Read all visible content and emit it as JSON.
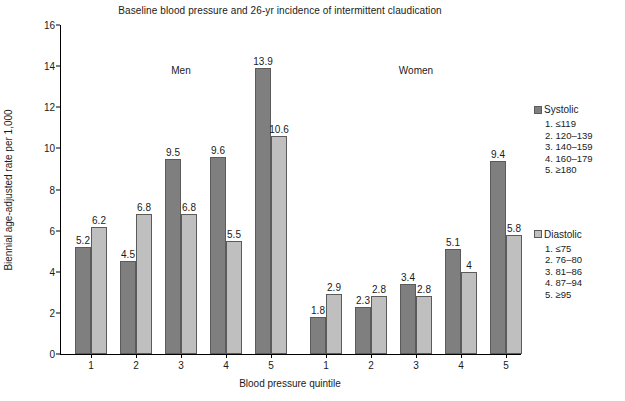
{
  "chart_data": {
    "type": "bar",
    "title": "Baseline blood pressure and 26-yr incidence of intermittent claudication",
    "xlabel": "Blood pressure quintile",
    "ylabel": "Biennial age-adjusted rate per 1,000",
    "ylim": [
      0,
      16
    ],
    "ytick_step": 2,
    "yticks": [
      "0",
      "2",
      "4",
      "6",
      "8",
      "10",
      "12",
      "14",
      "16"
    ],
    "grid": false,
    "legend_position": "right",
    "categories": [
      "1",
      "2",
      "3",
      "4",
      "5"
    ],
    "groups": [
      {
        "name": "Men",
        "categories": [
          "1",
          "2",
          "3",
          "4",
          "5"
        ],
        "series": [
          {
            "name": "Systolic",
            "values": [
              5.2,
              4.5,
              9.5,
              9.6,
              13.9
            ],
            "labels": [
              "5.2",
              "4.5",
              "9.5",
              "9.6",
              "13.9"
            ]
          },
          {
            "name": "Diastolic",
            "values": [
              6.2,
              6.8,
              6.8,
              5.5,
              10.6
            ],
            "labels": [
              "6.2",
              "6.8",
              "6.8",
              "5.5",
              "10.6"
            ]
          }
        ]
      },
      {
        "name": "Women",
        "categories": [
          "1",
          "2",
          "3",
          "4",
          "5"
        ],
        "series": [
          {
            "name": "Systolic",
            "values": [
              1.8,
              2.3,
              3.4,
              5.1,
              9.4
            ],
            "labels": [
              "1.8",
              "2.3",
              "3.4",
              "5.1",
              "9.4"
            ]
          },
          {
            "name": "Diastolic",
            "values": [
              2.9,
              2.8,
              2.8,
              4.0,
              5.8
            ],
            "labels": [
              "2.9",
              "2.8",
              "2.8",
              "4",
              "5.8"
            ]
          }
        ]
      }
    ],
    "colors": {
      "systolic": "#7f7f7f",
      "diastolic": "#bfbfbf",
      "bar_border": "#5b5b5b",
      "axis": "#000000"
    }
  },
  "legend": {
    "systolic": {
      "title": "Systolic",
      "items": [
        "1. ≤119",
        "2. 120–139",
        "3. 140–159",
        "4. 160–179",
        "5. ≥180"
      ]
    },
    "diastolic": {
      "title": "Diastolic",
      "items": [
        "1. ≤75",
        "2. 76–80",
        "3. 81–86",
        "4. 87–94",
        "5. ≥95"
      ]
    }
  }
}
